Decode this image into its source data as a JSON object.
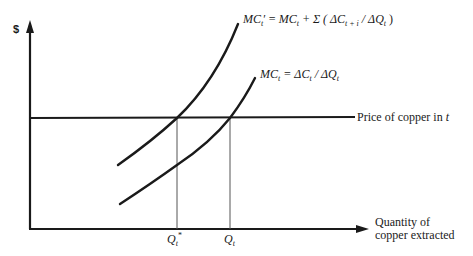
{
  "diagram": {
    "y_axis": {
      "label": "$"
    },
    "x_axis": {
      "label_line1": "Quantity of",
      "label_line2": "copper extracted"
    },
    "price_line": {
      "label": "Price of copper in t",
      "label_main": "Price of copper in ",
      "label_var": "t"
    },
    "curves": {
      "mc_prime": {
        "label": "MC't = MCt + Σ(ΔCt+i / ΔQt)",
        "parts": {
          "mc1": "MC",
          "sub1": "t",
          "prime": "′",
          "eq": " = ",
          "mc2": "MC",
          "sub2": "t",
          "plus": " + Σ ( ΔC",
          "sub3": "t + i",
          "div": " / ΔQ",
          "sub4": "t",
          "close": " )"
        }
      },
      "mc": {
        "label": "MCt = ΔCt / ΔQt",
        "parts": {
          "mc": "MC",
          "sub1": "t",
          "eq": " = ΔC",
          "sub2": "t",
          "div": " / ΔQ",
          "sub3": "t"
        }
      }
    },
    "ticks": {
      "q_star": {
        "main": "Q",
        "sub": "t",
        "sup": "*"
      },
      "q_t": {
        "main": "Q",
        "sub": "t"
      }
    },
    "colors": {
      "line": "#1a1a1a",
      "guide": "#555555",
      "background": "#ffffff"
    }
  }
}
